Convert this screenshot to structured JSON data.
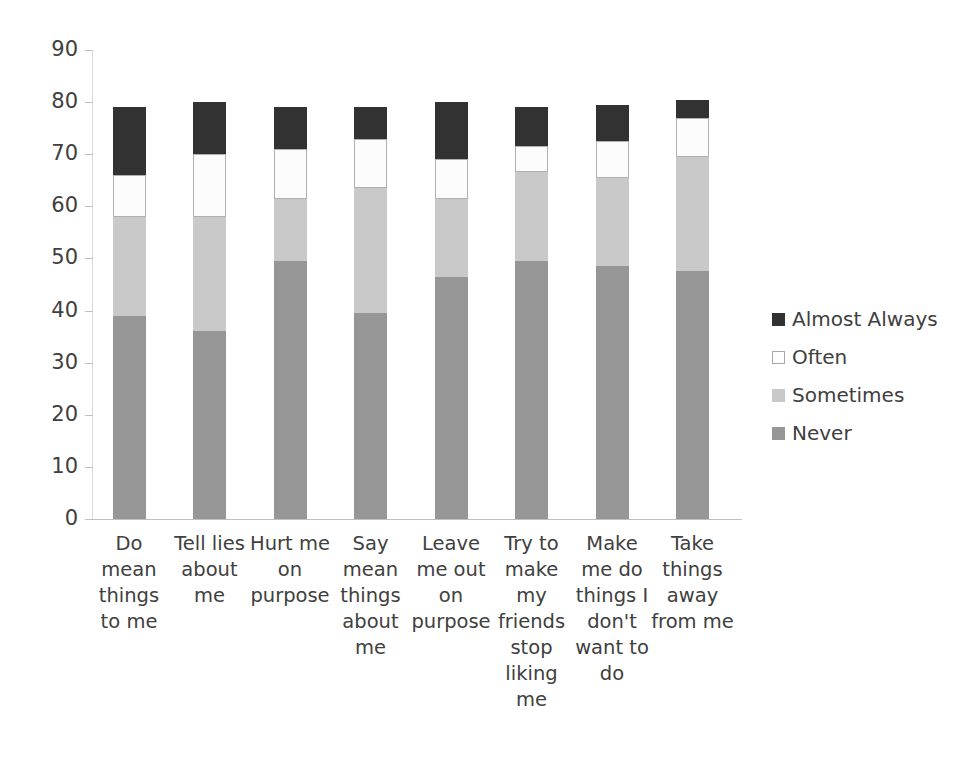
{
  "chart_data": {
    "type": "bar",
    "subtype": "stacked-bar-vertical",
    "title": "",
    "xlabel": "",
    "ylabel": "",
    "ylim": [
      0,
      90
    ],
    "ytick_step": 10,
    "yticks": [
      0,
      10,
      20,
      30,
      40,
      50,
      60,
      70,
      80,
      90
    ],
    "ytick_labels": [
      "0",
      "10",
      "20",
      "30",
      "40",
      "50",
      "60",
      "70",
      "80",
      "90"
    ],
    "grid": false,
    "legend_position": "right",
    "stack_order_bottom_to_top": [
      "Never",
      "Sometimes",
      "Often",
      "Almost Always"
    ],
    "categories": [
      "Do mean things to me",
      "Tell lies about me",
      "Hurt me on purpose",
      "Say mean things about me",
      "Leave me out on purpose",
      "Try to make my friends stop liking me",
      "Make me do things I don't want to do",
      "Take things away from me"
    ],
    "category_label_lines": [
      [
        "Do",
        "mean",
        "things",
        "to me"
      ],
      [
        "Tell lies",
        "about",
        "me"
      ],
      [
        "Hurt me",
        "on",
        "purpose"
      ],
      [
        "Say",
        "mean",
        "things",
        "about",
        "me"
      ],
      [
        "Leave",
        "me out",
        "on",
        "purpose"
      ],
      [
        "Try to",
        "make",
        "my",
        "friends",
        "stop",
        "liking",
        "me"
      ],
      [
        "Make",
        "me do",
        "things I",
        "don't",
        "want to",
        "do"
      ],
      [
        "Take",
        "things",
        "away",
        "from me"
      ]
    ],
    "series": [
      {
        "name": "Never",
        "color": "#969696",
        "values": [
          39,
          36,
          49.5,
          39.5,
          46.5,
          49.5,
          48.5,
          47.5
        ]
      },
      {
        "name": "Sometimes",
        "color": "#c9c9c9",
        "values": [
          19,
          22,
          12,
          24,
          15,
          17,
          17,
          22
        ]
      },
      {
        "name": "Often",
        "color": "#ffffff",
        "values": [
          8,
          12,
          9.5,
          9.5,
          7.5,
          5,
          7,
          7.5
        ]
      },
      {
        "name": "Almost Always",
        "color": "#323232",
        "values": [
          13,
          10,
          8,
          6,
          11,
          7.5,
          7,
          3.5
        ]
      }
    ],
    "cumulative_tops": [
      {
        "category": "Do mean things to me",
        "never": 39,
        "sometimes": 58,
        "often": 66,
        "almost_always": 79
      },
      {
        "category": "Tell lies about me",
        "never": 36,
        "sometimes": 58,
        "often": 70,
        "almost_always": 80
      },
      {
        "category": "Hurt me on purpose",
        "never": 49.5,
        "sometimes": 61.5,
        "often": 71,
        "almost_always": 79
      },
      {
        "category": "Say mean things about me",
        "never": 39.5,
        "sometimes": 63.5,
        "often": 73,
        "almost_always": 79
      },
      {
        "category": "Leave me out on purpose",
        "never": 46.5,
        "sometimes": 61.5,
        "often": 69,
        "almost_always": 80
      },
      {
        "category": "Try to make my friends stop liking me",
        "never": 49.5,
        "sometimes": 66.5,
        "often": 71.5,
        "almost_always": 79
      },
      {
        "category": "Make me do things I don't want to do",
        "never": 48.5,
        "sometimes": 65.5,
        "often": 72.5,
        "almost_always": 79.5
      },
      {
        "category": "Take things away from me",
        "never": 47.5,
        "sometimes": 69.5,
        "often": 77,
        "almost_always": 80.5
      }
    ],
    "legend_entries": [
      {
        "label": "Almost Always",
        "color": "#323232"
      },
      {
        "label": "Often",
        "color": "#ffffff"
      },
      {
        "label": "Sometimes",
        "color": "#c9c9c9"
      },
      {
        "label": "Never",
        "color": "#969696"
      }
    ]
  }
}
